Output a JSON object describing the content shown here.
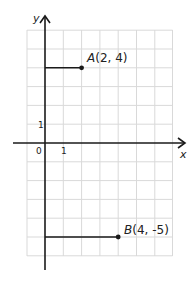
{
  "diagram": {
    "type": "coordinate-grid",
    "axes": {
      "x_label": "x",
      "y_label": "y",
      "origin_label": "0",
      "x_unit_label": "1",
      "y_unit_label": "1"
    },
    "grid": {
      "x_min": -1,
      "x_max": 7,
      "y_min": -6,
      "y_max": 6,
      "spacing_px": 18.6
    },
    "points": [
      {
        "name": "A",
        "coords": "(2, 4)",
        "x": 2,
        "y": 4
      },
      {
        "name": "B",
        "coords": "(4, -5)",
        "x": 4,
        "y": -5
      }
    ],
    "colors": {
      "grid": "#d9d9d9",
      "axis": "#1a1a1a",
      "segment": "#1a1a1a"
    }
  }
}
